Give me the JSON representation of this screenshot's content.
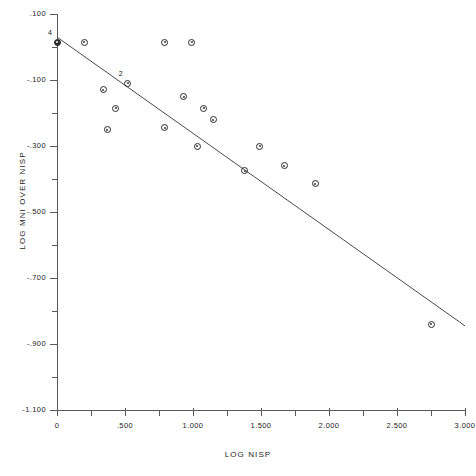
{
  "chart_data": {
    "type": "scatter",
    "title": "",
    "xlabel": "LOG NISP",
    "ylabel": "LOG MNI OVER NISP",
    "xlim": [
      0,
      3.0
    ],
    "ylim": [
      -1.1,
      0.1
    ],
    "grid": false,
    "legend": null,
    "x_ticks": [
      {
        "value": 0,
        "label": "0"
      },
      {
        "value": 0.25,
        "label": ""
      },
      {
        "value": 0.5,
        "label": ".500"
      },
      {
        "value": 0.75,
        "label": ""
      },
      {
        "value": 1.0,
        "label": "1.000"
      },
      {
        "value": 1.25,
        "label": ""
      },
      {
        "value": 1.5,
        "label": "1.500"
      },
      {
        "value": 1.75,
        "label": ""
      },
      {
        "value": 2.0,
        "label": "2.000"
      },
      {
        "value": 2.25,
        "label": ""
      },
      {
        "value": 2.5,
        "label": "2.500"
      },
      {
        "value": 2.75,
        "label": ""
      },
      {
        "value": 3.0,
        "label": "3.000"
      }
    ],
    "y_ticks": [
      {
        "value": 0.1,
        "label": ".100"
      },
      {
        "value": 0.0,
        "label": ""
      },
      {
        "value": -0.1,
        "label": "-.100"
      },
      {
        "value": -0.2,
        "label": ""
      },
      {
        "value": -0.3,
        "label": "-.300"
      },
      {
        "value": -0.4,
        "label": ""
      },
      {
        "value": -0.5,
        "label": "-.500"
      },
      {
        "value": -0.6,
        "label": ""
      },
      {
        "value": -0.7,
        "label": "-.700"
      },
      {
        "value": -0.8,
        "label": ""
      },
      {
        "value": -0.9,
        "label": "-.900"
      },
      {
        "value": -1.0,
        "label": ""
      },
      {
        "value": -1.1,
        "label": "-1.100"
      }
    ],
    "points": [
      {
        "x": 0.0,
        "y": 0.015,
        "count": 4,
        "count_label": "4",
        "overplot": true
      },
      {
        "x": 0.2,
        "y": 0.015,
        "count": 1,
        "count_label": "",
        "overplot": false
      },
      {
        "x": 0.79,
        "y": 0.015,
        "count": 1,
        "count_label": "",
        "overplot": false
      },
      {
        "x": 0.99,
        "y": 0.015,
        "count": 1,
        "count_label": "",
        "overplot": false
      },
      {
        "x": 0.34,
        "y": -0.13,
        "count": 1,
        "count_label": "",
        "overplot": false
      },
      {
        "x": 0.43,
        "y": -0.185,
        "count": 1,
        "count_label": "",
        "overplot": false
      },
      {
        "x": 0.52,
        "y": -0.11,
        "count": 2,
        "count_label": "2",
        "overplot": false
      },
      {
        "x": 0.93,
        "y": -0.15,
        "count": 1,
        "count_label": "",
        "overplot": false
      },
      {
        "x": 1.08,
        "y": -0.185,
        "count": 1,
        "count_label": "",
        "overplot": false
      },
      {
        "x": 0.37,
        "y": -0.25,
        "count": 1,
        "count_label": "",
        "overplot": false
      },
      {
        "x": 0.79,
        "y": -0.245,
        "count": 1,
        "count_label": "",
        "overplot": false
      },
      {
        "x": 1.15,
        "y": -0.22,
        "count": 1,
        "count_label": "",
        "overplot": false
      },
      {
        "x": 1.03,
        "y": -0.3,
        "count": 1,
        "count_label": "",
        "overplot": false
      },
      {
        "x": 1.49,
        "y": -0.3,
        "count": 1,
        "count_label": "",
        "overplot": false
      },
      {
        "x": 1.38,
        "y": -0.375,
        "count": 1,
        "count_label": "",
        "overplot": false
      },
      {
        "x": 1.67,
        "y": -0.36,
        "count": 1,
        "count_label": "",
        "overplot": false
      },
      {
        "x": 1.9,
        "y": -0.415,
        "count": 1,
        "count_label": "",
        "overplot": false
      },
      {
        "x": 2.75,
        "y": -0.84,
        "count": 1,
        "count_label": "",
        "overplot": false
      }
    ],
    "fit_line": {
      "type": "linear-regression",
      "x0": 0.0,
      "y0": 0.03,
      "x1": 3.0,
      "y1": -0.845
    }
  }
}
